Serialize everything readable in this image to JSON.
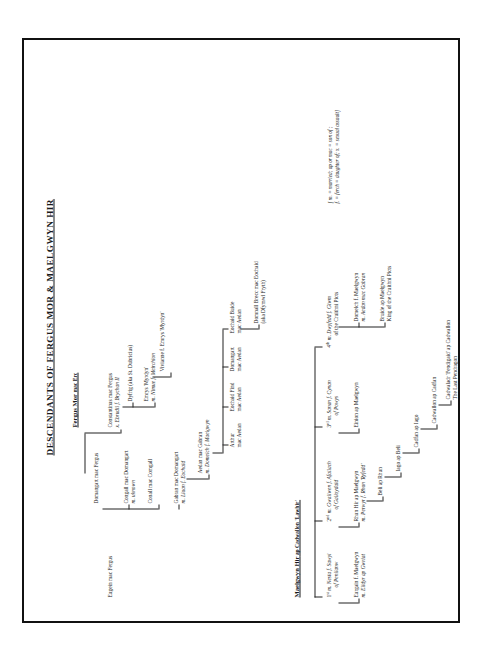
{
  "document": {
    "title": "DESCENDANTS OF FERGUS MOR & MAELGWYN HIR"
  },
  "sections": {
    "fergus": {
      "heading_main": "Fergus Mor",
      "heading_sub": " mac Erc"
    },
    "maelgwyn": {
      "heading_main": "Maelgwyn Hir",
      "heading_sub": " ap Cadwallon 'Lawhir'"
    }
  },
  "nodes": {
    "eugein": {
      "l1": "Eugein mac Fergus"
    },
    "domangart1": {
      "l1": "Domangart mac Fergus"
    },
    "congall": {
      "l1": "Congall mac Domangart",
      "l2": "m. uknown"
    },
    "conall": {
      "l1": "Conall mac Comgall"
    },
    "constantinus": {
      "l1": "Constantinus mac Fergus",
      "l2": "x. Ebrudil f. Brychan II"
    },
    "dyfrig": {
      "l1": "Dyfrig (aka St. Dubricius)"
    },
    "emrys": {
      "l1": "Emrys 'Myrdyn'",
      "l2": "m. Nimue f. Meirchion"
    },
    "vivianne": {
      "l1": "Vivianne f. Emrys 'Myrdyn'"
    },
    "gabran": {
      "l1": "Gabran mac Domangart",
      "l2": "m. Lluan f. Eochaid"
    },
    "aedan": {
      "l1": "Aedan mac Gabran",
      "l2": "m. Domelch f. Maelgwyn"
    },
    "arthur": {
      "l1": "Arthur",
      "l2": "mac Aedan"
    },
    "eochaid_find": {
      "l1": "Eochaid Find",
      "l2": "mac Aedan"
    },
    "domangart2": {
      "l1": "Domangart",
      "l2": "mac Aedan"
    },
    "eochaid_buide": {
      "l1": "Eochaid Buide",
      "l2": "mac Aedan"
    },
    "domnall_brecc": {
      "l1": "Domnall Brecc mac Eochaid",
      "l2": "(aka Dfymwl Fryth)"
    },
    "nesta": {
      "l1": "1",
      "sup": "st",
      "l1b": " m. Nesta f. Sawyl",
      "l2": "of Penllanw"
    },
    "eurgain": {
      "l1": "Eurgain f. Maelgwyn",
      "l2": "m. Elidyr ap Gwriat"
    },
    "gwallwen": {
      "l1": "2",
      "sup": "nd",
      "l1b": " m. Gwallwen f. Afallach",
      "l2": "of Galloydaid"
    },
    "rhun": {
      "l1": "Rhun Hir ap Maelgwyn",
      "l2": "m. Perwyr f. Rhun 'Ryfedd'"
    },
    "beli": {
      "l1": "Beli ap Rhun"
    },
    "iago": {
      "l1": "Iago ap Beli"
    },
    "cadfan": {
      "l1": "Cadfan ap Iago"
    },
    "cadwallon": {
      "l1": "Cadwallon ap Cadfan"
    },
    "cadwaladr": {
      "l1": "Cadwaladr 'Fendigaid' ap Cadwallon",
      "l2": "The Last Pendragon"
    },
    "sanan": {
      "l1": "3",
      "sup": "rd",
      "l1b": " m. Sanan f. Cynan",
      "l2": "of Powys"
    },
    "einion": {
      "l1": "Einion ap Maelgwyn"
    },
    "dwyfedd": {
      "l1": "4",
      "sup": "th",
      "l1b": " m. Dwyfedd f. Giwm",
      "l2": "of the Cruithni Picts"
    },
    "domelch": {
      "l1": "Domelch f. Maelgwyn",
      "l2": "m. Aedan mac Gabran"
    },
    "bruide": {
      "l1": "Bruide ap Maelgwyn",
      "l2": "King of the Cruithni Picts"
    }
  },
  "legend": {
    "l1": "[ m. = married; ap or mac = son of ;",
    "l2": "f. = ferch = daughter of; x. = sexual assault]"
  }
}
